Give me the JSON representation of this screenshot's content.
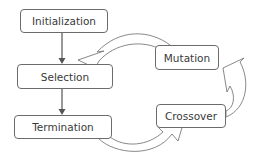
{
  "diagram": {
    "type": "flowchart",
    "nodes": [
      {
        "id": "initialization",
        "label": "Initialization"
      },
      {
        "id": "selection",
        "label": "Selection"
      },
      {
        "id": "termination",
        "label": "Termination"
      },
      {
        "id": "mutation",
        "label": "Mutation"
      },
      {
        "id": "crossover",
        "label": "Crossover"
      }
    ],
    "edges": [
      {
        "from": "initialization",
        "to": "selection",
        "style": "straight-arrow"
      },
      {
        "from": "selection",
        "to": "termination",
        "style": "straight-arrow"
      },
      {
        "from": "termination",
        "to": "crossover",
        "style": "curved-block-arrow"
      },
      {
        "from": "crossover",
        "to": "mutation",
        "style": "curved-block-arrow"
      },
      {
        "from": "mutation",
        "to": "selection",
        "style": "curved-block-arrow"
      }
    ],
    "colors": {
      "stroke": "#6b6b6b",
      "text": "#3a3a3a",
      "background": "#ffffff"
    }
  }
}
